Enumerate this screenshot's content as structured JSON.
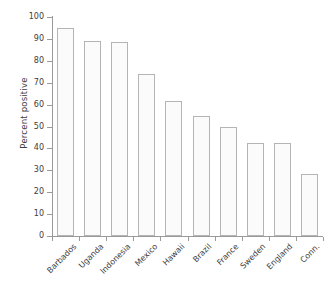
{
  "chart_data": {
    "type": "bar",
    "title": "",
    "subtitle": "",
    "xlabel": "",
    "ylabel": "Percent positive",
    "categories": [
      "Barbados",
      "Uganda",
      "Indonesia",
      "Mexico",
      "Hawaii",
      "Brazil",
      "France",
      "Sweden",
      "England",
      "Conn."
    ],
    "values": [
      95,
      89,
      88.5,
      74,
      61.5,
      55,
      50,
      42.5,
      42.5,
      28.5
    ],
    "ylim": [
      0,
      100
    ],
    "yticks": [
      0,
      10,
      20,
      30,
      40,
      50,
      60,
      70,
      80,
      90,
      100
    ],
    "ytick_labels": [
      "0",
      "10",
      "20",
      "30",
      "40",
      "50",
      "60",
      "70",
      "80",
      "90",
      "100"
    ],
    "grid": false,
    "legend": null,
    "legend_position": "none",
    "annotations": [],
    "bar_fill_color": "#fbfbfb",
    "bar_edge_color": "#b4b4b4",
    "axis_color": "#9a9a9a",
    "text_color": "#3d3d3d",
    "background_color": "#ffffff"
  }
}
